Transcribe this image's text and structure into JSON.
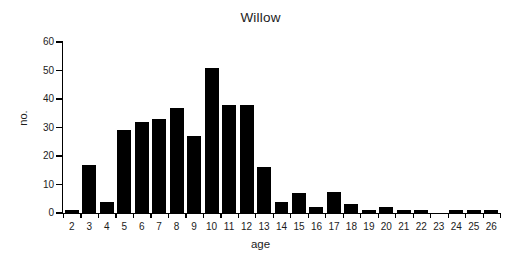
{
  "chart_data": {
    "type": "bar",
    "title": "Willow",
    "xlabel": "age",
    "ylabel": "no.",
    "categories": [
      "2",
      "3",
      "4",
      "5",
      "6",
      "7",
      "8",
      "9",
      "10",
      "11",
      "12",
      "13",
      "14",
      "15",
      "16",
      "17",
      "18",
      "19",
      "20",
      "21",
      "22",
      "23",
      "24",
      "25",
      "26"
    ],
    "values": [
      1,
      17,
      4,
      29,
      32,
      33,
      37,
      27,
      51,
      38,
      38,
      16,
      4,
      7,
      2,
      7.5,
      3,
      1,
      2,
      1,
      1,
      0,
      1,
      1,
      1
    ],
    "ylim": [
      0,
      60
    ],
    "y_ticks": [
      0,
      10,
      20,
      30,
      40,
      50,
      60
    ],
    "y_tick_labels": [
      "0",
      "10",
      "20",
      "30",
      "40",
      "50",
      "60"
    ],
    "grid": false,
    "legend": "none",
    "bar_color": "#000000",
    "axis_color": "#000000",
    "background_color": "#ffffff"
  }
}
